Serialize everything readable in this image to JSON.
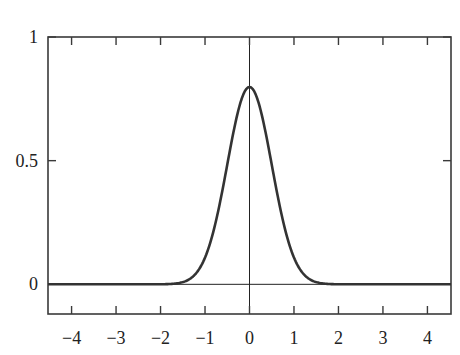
{
  "chart_data": {
    "type": "line",
    "title": "",
    "xlabel": "",
    "ylabel": "",
    "xlim": [
      -4.53,
      4.53
    ],
    "ylim": [
      -0.12,
      1.0
    ],
    "grid": false,
    "legend": null,
    "x_ticks": [
      -4,
      -3,
      -2,
      -1,
      0,
      1,
      2,
      3,
      4
    ],
    "x_tick_labels": [
      "−4",
      "−3",
      "−2",
      "−1",
      "0",
      "1",
      "2",
      "3",
      "4"
    ],
    "y_ticks": [
      0,
      0.5,
      1
    ],
    "y_tick_labels": [
      "0",
      "0.5",
      "1"
    ],
    "reference_lines": {
      "horizontal_y": 0,
      "vertical_x": 0
    },
    "series": [
      {
        "name": "normal density, mean 0, sd 0.5",
        "function": "normal_pdf",
        "mean": 0,
        "sd": 0.5,
        "color": "#333333",
        "x": [
          -4.5,
          -3,
          -2,
          -1.5,
          -1.25,
          -1,
          -0.75,
          -0.5,
          -0.25,
          0,
          0.25,
          0.5,
          0.75,
          1,
          1.25,
          1.5,
          2,
          3,
          4.5
        ],
        "values": [
          0.0,
          0.0,
          0.0001,
          0.0089,
          0.035,
          0.108,
          0.259,
          0.484,
          0.704,
          0.798,
          0.704,
          0.484,
          0.259,
          0.108,
          0.035,
          0.0089,
          0.0001,
          0.0,
          0.0
        ]
      }
    ]
  },
  "colors": {
    "frame": "#3a3a3a",
    "curve": "#333333",
    "background": "#ffffff"
  }
}
